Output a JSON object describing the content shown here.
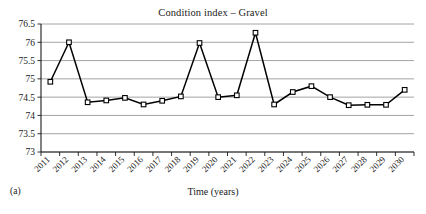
{
  "figure": {
    "panel_label": "(a)",
    "title": "Condition index – Gravel",
    "xaxis_title": "Time (years)"
  },
  "chart_data": {
    "type": "line",
    "title": "Condition index – Gravel",
    "xlabel": "Time (years)",
    "ylabel": "",
    "ylim": [
      73,
      76.5
    ],
    "ytick_step": 0.5,
    "yticks": [
      "73",
      "73.5",
      "74",
      "74.5",
      "75",
      "75.5",
      "76",
      "76.5"
    ],
    "grid": "horizontal",
    "legend": "none",
    "marker": "open-square",
    "line_color": "#000000",
    "grid_color": "#9a9a9a",
    "categories": [
      "2011",
      "2012",
      "2013",
      "2014",
      "2015",
      "2016",
      "2017",
      "2018",
      "2019",
      "2020",
      "2021",
      "2022",
      "2023",
      "2024",
      "2025",
      "2026",
      "2027",
      "2028",
      "2029",
      "2030"
    ],
    "values": [
      74.92,
      76.0,
      74.36,
      74.41,
      74.48,
      74.3,
      74.4,
      74.52,
      75.98,
      74.5,
      74.55,
      76.26,
      74.3,
      74.64,
      74.8,
      74.5,
      74.28,
      74.29,
      74.29,
      74.7
    ],
    "series": [
      {
        "name": "Condition index – Gravel",
        "values": [
          74.92,
          76.0,
          74.36,
          74.41,
          74.48,
          74.3,
          74.4,
          74.52,
          75.98,
          74.5,
          74.55,
          76.26,
          74.3,
          74.64,
          74.8,
          74.5,
          74.28,
          74.29,
          74.29,
          74.7
        ]
      }
    ]
  }
}
